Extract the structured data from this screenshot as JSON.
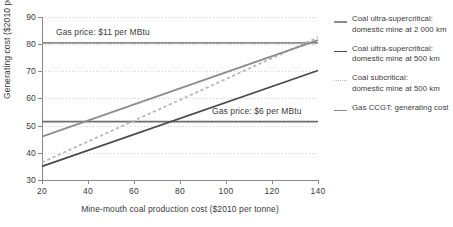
{
  "chart_data": {
    "type": "line",
    "title": "",
    "xlabel": "Mine-mouth coal production cost ($2010 per tonne)",
    "ylabel": "Generating cost ($2010 per MWh)",
    "xlim": [
      20,
      140
    ],
    "ylim": [
      30,
      90
    ],
    "xticks": [
      20,
      40,
      60,
      80,
      100,
      120,
      140
    ],
    "yticks": [
      30,
      40,
      50,
      60,
      70,
      80,
      90
    ],
    "grid": "horizontal dotted",
    "legend_position": "right",
    "series": [
      {
        "name": "Coal ultra-supercritical: domestic mine at 2 000 km",
        "style": "solid",
        "color": "#8c8c8c",
        "x": [
          20,
          140
        ],
        "y": [
          46.0,
          81.5
        ]
      },
      {
        "name": "Coal ultra-supercritical: domestic mine at 500 km",
        "style": "solid",
        "color": "#4a4a4a",
        "x": [
          20,
          140
        ],
        "y": [
          35.0,
          70.3
        ]
      },
      {
        "name": "Coal subcritical: domestic mine at 500 km",
        "style": "dotted",
        "color": "#b9b9b9",
        "x": [
          20,
          140
        ],
        "y": [
          36.5,
          82.5
        ]
      },
      {
        "name": "Gas CCGT: generating cost",
        "style": "solid",
        "color": "#8c8c8c",
        "x": [
          20,
          140
        ],
        "y": [
          80.5,
          80.5
        ],
        "annotation": "Gas price: $11 per MBtu"
      },
      {
        "name": "Gas CCGT: generating cost",
        "style": "solid",
        "color": "#6e6e6e",
        "x": [
          20,
          140
        ],
        "y": [
          51.5,
          51.5
        ],
        "annotation": "Gas price: $6 per MBtu"
      }
    ],
    "annotations": [
      {
        "text": "Gas price: $11 per MBtu",
        "x": 30,
        "y": 83.5
      },
      {
        "text": "Gas price: $6 per MBtu",
        "x": 132,
        "y": 54.0
      }
    ]
  },
  "axes": {
    "y_title": "Generating cost ($2010 per MWh)",
    "x_title": "Mine-mouth coal production cost ($2010 per tonne)",
    "y_ticks": [
      "90",
      "80",
      "70",
      "60",
      "50",
      "40",
      "30"
    ],
    "x_ticks": [
      "20",
      "40",
      "60",
      "80",
      "100",
      "120",
      "140"
    ]
  },
  "annotations": {
    "gas11": "Gas price: $11 per MBtu",
    "gas6": "Gas price: $6 per MBtu"
  },
  "legend": {
    "items": [
      {
        "line1": "Coal ultra-supercritical:",
        "line2": "domestic mine at 2 000 km",
        "swatch": "solid-gray",
        "color": "#8c8c8c"
      },
      {
        "line1": "Coal ultra-supercritical:",
        "line2": "domestic mine at 500 km",
        "swatch": "solid-dark",
        "color": "#4a4a4a"
      },
      {
        "line1": "Coal subcritical:",
        "line2": "domestic mine at 500 km",
        "swatch": "dotted-gray",
        "color": "#b9b9b9"
      },
      {
        "line1": "Gas CCGT: generating cost",
        "line2": "",
        "swatch": "solid-gray",
        "color": "#8c8c8c"
      }
    ]
  }
}
